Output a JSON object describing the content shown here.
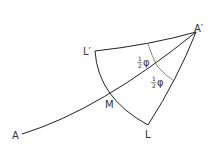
{
  "diagram": {
    "points": {
      "A": {
        "label": "A",
        "x": 20,
        "y": 134
      },
      "A_prime": {
        "label": "A′",
        "x": 196,
        "y": 32
      },
      "L_prime": {
        "label": "L′",
        "x": 95,
        "y": 51
      },
      "L": {
        "label": "L",
        "x": 148,
        "y": 125
      },
      "M": {
        "label": "M",
        "x": 111,
        "y": 97
      }
    },
    "angle_labels": [
      {
        "num": "1",
        "den": "2",
        "symbol": "φ"
      },
      {
        "num": "1",
        "den": "2",
        "symbol": "φ"
      }
    ],
    "stroke_color": "#222222"
  }
}
